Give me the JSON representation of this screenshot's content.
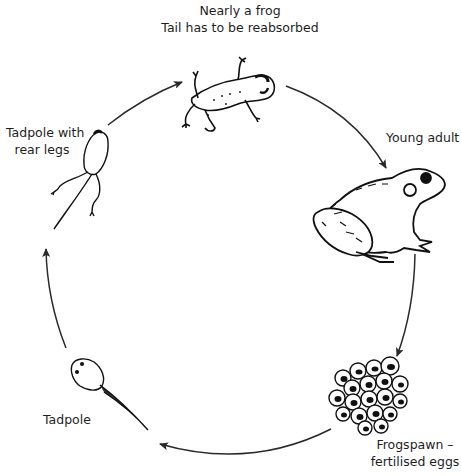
{
  "stages": [
    {
      "id": "nearly-frog",
      "lines": [
        "Nearly a frog",
        "Tail has to be reabsorbed"
      ]
    },
    {
      "id": "young-adult",
      "lines": [
        "Young adult"
      ]
    },
    {
      "id": "frogspawn",
      "lines": [
        "Frogspawn –",
        "fertilised eggs"
      ]
    },
    {
      "id": "tadpole",
      "lines": [
        "Tadpole"
      ]
    },
    {
      "id": "tadpole-rear-legs",
      "lines": [
        "Tadpole with",
        "rear legs"
      ]
    }
  ],
  "cycle_order": [
    "Frogspawn – fertilised eggs",
    "Tadpole",
    "Tadpole with rear legs",
    "Nearly a frog",
    "Young adult"
  ],
  "colors": {
    "line": "#2a2a2a",
    "ink": "#111111",
    "background": "#ffffff"
  }
}
